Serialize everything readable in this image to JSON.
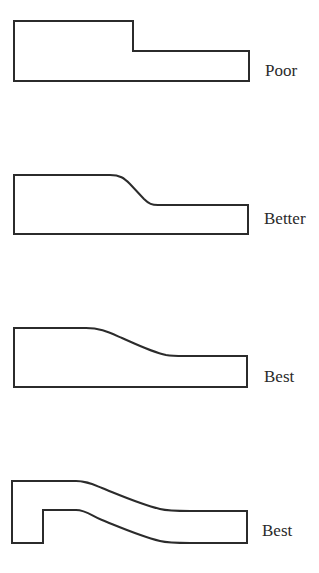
{
  "figure": {
    "stroke_color": "#2b2b2b",
    "background_color": "#ffffff",
    "profiles": [
      {
        "id": "profile-1",
        "rating": "Poor",
        "feature": "sharp step"
      },
      {
        "id": "profile-2",
        "rating": "Better",
        "feature": "short fillet transition"
      },
      {
        "id": "profile-3",
        "rating": "Best",
        "feature": "long gradual transition"
      },
      {
        "id": "profile-4",
        "rating": "Best",
        "feature": "uniform wall thickness with gradual transition"
      }
    ]
  }
}
